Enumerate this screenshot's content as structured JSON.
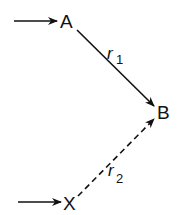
{
  "diagram": {
    "nodes": [
      {
        "id": "A",
        "label": "A",
        "x": 67,
        "y": 21
      },
      {
        "id": "B",
        "label": "B",
        "x": 163,
        "y": 112
      },
      {
        "id": "X",
        "label": "X",
        "x": 71,
        "y": 203
      }
    ],
    "edges": [
      {
        "from": "A",
        "to": "B",
        "label": "r",
        "subscript": "1",
        "style": "solid"
      },
      {
        "from": "X",
        "to": "B",
        "label": "r",
        "subscript": "2",
        "style": "dashed"
      }
    ],
    "inputs": [
      {
        "to": "A",
        "style": "solid"
      },
      {
        "to": "X",
        "style": "solid"
      }
    ],
    "color": "#111111"
  }
}
